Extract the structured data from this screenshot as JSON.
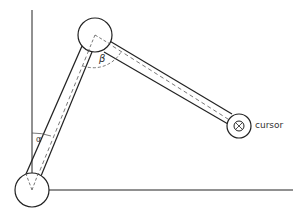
{
  "diagram": {
    "type": "two-link arm",
    "labels": {
      "alpha": "α",
      "beta": "β",
      "cursor": "cursor"
    },
    "colors": {
      "stroke": "#222222",
      "dash": "#555555",
      "background": "#ffffff"
    },
    "joints": [
      {
        "name": "base",
        "cx": 32,
        "cy": 190,
        "r": 17
      },
      {
        "name": "elbow",
        "cx": 95,
        "cy": 35,
        "r": 17
      },
      {
        "name": "cursor",
        "cx": 239,
        "cy": 126,
        "r": 12
      }
    ]
  }
}
